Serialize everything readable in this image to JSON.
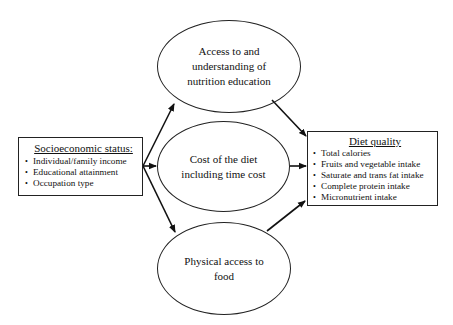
{
  "diagram": {
    "source": {
      "title": "Socioeconomic status:",
      "items": [
        "Individual/family income",
        "Educational attainment",
        "Occupation type"
      ]
    },
    "mediators": [
      {
        "label": "Access to and understanding of nutrition education",
        "lines": [
          "Access to and",
          "understanding of",
          "nutrition education"
        ]
      },
      {
        "label": "Cost of the diet including time cost",
        "lines": [
          "Cost of the diet",
          "including time cost"
        ]
      },
      {
        "label": "Physical access to food",
        "lines": [
          "Physical access to",
          "food"
        ]
      }
    ],
    "outcome": {
      "title": "Diet quality",
      "items": [
        "Total calories",
        "Fruits and vegetable intake",
        "Saturate and trans fat intake",
        "Complete protein intake",
        "Micronutrient intake"
      ]
    },
    "edges": [
      {
        "from": "Socioeconomic status",
        "to": "Access to and understanding of nutrition education"
      },
      {
        "from": "Socioeconomic status",
        "to": "Cost of the diet including time cost"
      },
      {
        "from": "Socioeconomic status",
        "to": "Physical access to food"
      },
      {
        "from": "Access to and understanding of nutrition education",
        "to": "Diet quality"
      },
      {
        "from": "Cost of the diet including time cost",
        "to": "Diet quality"
      },
      {
        "from": "Physical access to food",
        "to": "Diet quality"
      }
    ]
  }
}
